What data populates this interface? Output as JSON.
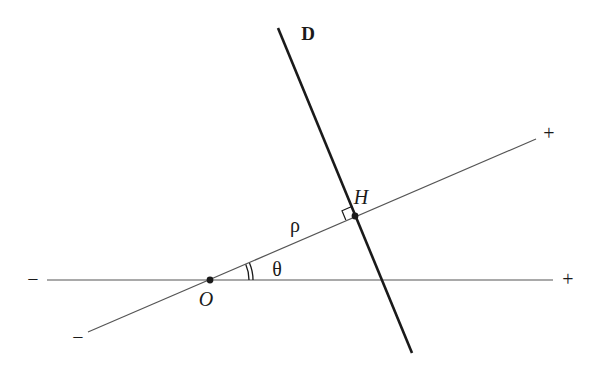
{
  "diagram": {
    "colors": {
      "axis": "#555555",
      "line_d": "#1a1a1a",
      "text": "#1a1a1a",
      "background": "#ffffff"
    },
    "horizontal_axis": {
      "x1": 47,
      "y1": 280,
      "x2": 553,
      "y2": 280,
      "neg_label": "−",
      "neg_label_x": 33,
      "neg_label_y": 286,
      "pos_label": "+",
      "pos_label_x": 568,
      "pos_label_y": 286
    },
    "oblique_axis": {
      "x1": 88,
      "y1": 332,
      "x2": 536,
      "y2": 139,
      "neg_label": "−",
      "neg_label_x": 78,
      "neg_label_y": 344,
      "pos_label": "+",
      "pos_label_x": 549,
      "pos_label_y": 140
    },
    "line_d": {
      "x1": 278,
      "y1": 28,
      "x2": 412,
      "y2": 353,
      "label": "D",
      "label_x": 308,
      "label_y": 40
    },
    "point_o": {
      "x": 210,
      "y": 280,
      "label": "O",
      "label_x": 206,
      "label_y": 306
    },
    "point_h": {
      "x": 355,
      "y": 216,
      "label": "H",
      "label_x": 361,
      "label_y": 204
    },
    "rho": {
      "label": "ρ",
      "label_x": 295,
      "label_y": 232
    },
    "theta": {
      "label": "θ",
      "label_x": 277,
      "label_y": 276
    },
    "right_angle_marker": {
      "size": 10
    }
  }
}
